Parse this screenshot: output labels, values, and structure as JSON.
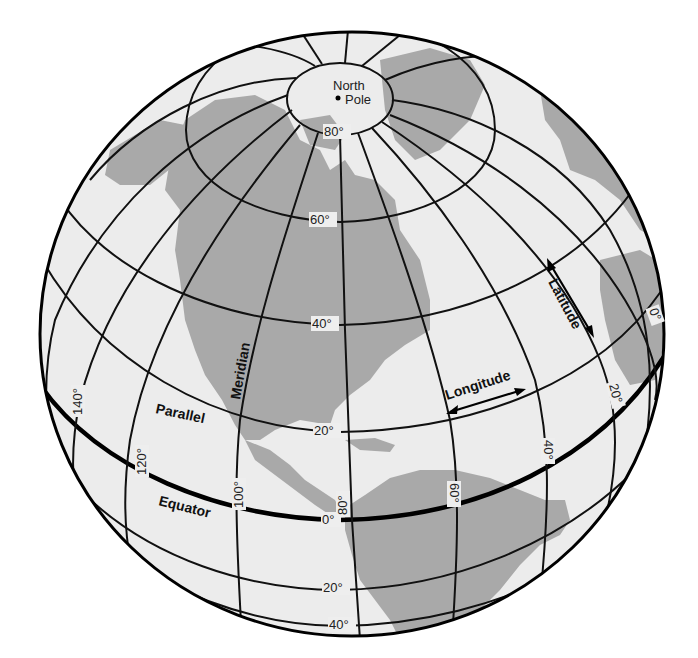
{
  "diagram": {
    "colors": {
      "ocean": "#ececec",
      "land": "#a9a9a9",
      "grid_lines": "#111111",
      "background": "#ffffff"
    },
    "pole_label_line1": "North",
    "pole_label_line2": "Pole",
    "terms": {
      "meridian": "Meridian",
      "parallel": "Parallel",
      "equator": "Equator",
      "latitude": "Latitude",
      "longitude": "Longitude"
    },
    "latitude_labels": {
      "lat80": "80°",
      "lat60": "60°",
      "lat40": "40°",
      "lat20": "20°",
      "lat0": "0°",
      "latS20": "20°",
      "latS40": "40°"
    },
    "longitude_labels": {
      "lon140": "140°",
      "lon120": "120°",
      "lon100": "100°",
      "lon80": "80°",
      "lon60": "60°",
      "lon40": "40°",
      "lon20": "20°",
      "lon0": "0°"
    }
  }
}
